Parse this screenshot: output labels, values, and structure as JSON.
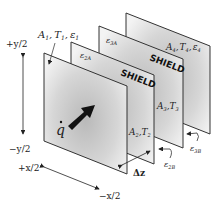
{
  "diagram": {
    "type": "radiation-shields",
    "plates": [
      {
        "id": "plate-1",
        "label_area": "A₁, T₁, ε₁",
        "emissivity_label": ""
      },
      {
        "id": "shield-2",
        "tag": "SHIELD",
        "label_area": "A₂,T₂",
        "eps_front": "ε₂ₐ",
        "eps_back": "ε₂ᵦ"
      },
      {
        "id": "shield-3",
        "tag": "SHIELD",
        "label_area": "A₃,T₃",
        "eps_front": "ε₃ₐ",
        "eps_back": "ε₃ᵦ"
      },
      {
        "id": "plate-4",
        "label_area": "A₄, T₄, ε₄"
      }
    ],
    "labels": {
      "a1": "A",
      "a1_sub": "1",
      "t1": "T",
      "t1_sub": "1",
      "e1": "ε",
      "e1_sub": "1",
      "a4": "A",
      "a4_sub": "4",
      "t4": "T",
      "t4_sub": "4",
      "e4": "ε",
      "e4_sub": "4",
      "a2": "A",
      "a2_sub": "2",
      "t2": "T",
      "t2_sub": "2",
      "a3": "A",
      "a3_sub": "3",
      "t3": "T",
      "t3_sub": "3",
      "eps": "ε",
      "e2a_sub": "2A",
      "e3a_sub": "3A",
      "e2b_sub": "2B",
      "e3b_sub": "3B",
      "shield": "SHIELD",
      "qdot": "q",
      "delta_z": "Δz",
      "plus_y": "+y/2",
      "minus_y": "−y/2",
      "plus_x": "+x/2",
      "minus_x": "−x/2",
      "comma": ","
    },
    "colors": {
      "plate_fill_light": "#f2f2f2",
      "plate_fill_dark": "#b8b8b8",
      "edge": "#333333",
      "arrow": "#111111"
    }
  }
}
